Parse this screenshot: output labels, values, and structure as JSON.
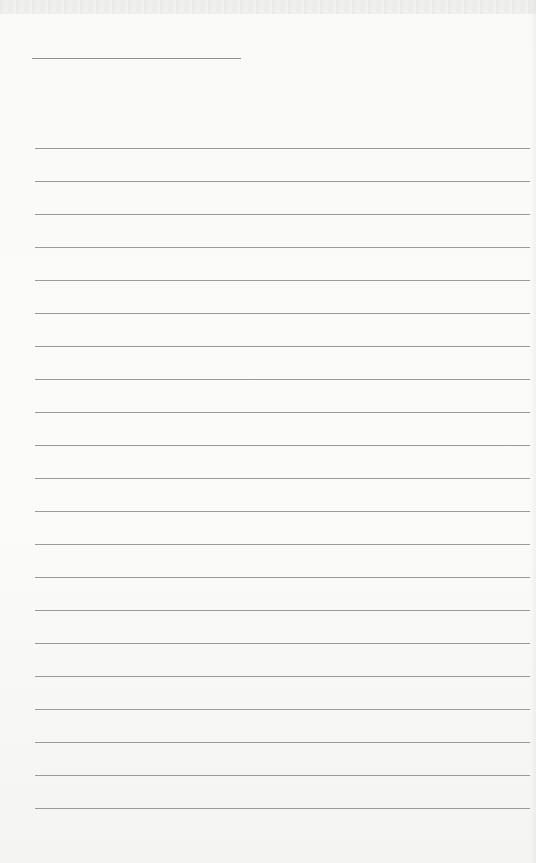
{
  "document": {
    "type": "lined-paper",
    "header_line": {
      "x": 32,
      "y": 58,
      "width": 209
    },
    "rules": {
      "count": 21,
      "first_y": 148,
      "spacing": 33,
      "x": 35,
      "width": 495,
      "color": "#9a9a9a"
    },
    "background_color": "#f8f8f7"
  }
}
